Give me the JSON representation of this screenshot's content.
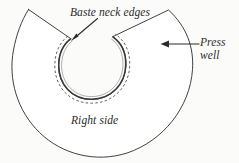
{
  "diagram": {
    "type": "sewing-pattern-illustration",
    "background_color": "#fbfbfa",
    "ink_color": "#2b2b2b",
    "labels": {
      "baste_neck_edges": "Baste neck edges",
      "press_well_line1": "Press",
      "press_well_line2": "well",
      "right_side": "Right side"
    },
    "annotations": [
      {
        "name": "baste-neck-edges",
        "text": "Baste neck edges",
        "arrow": "diagonal-down-left",
        "points_to": "neck-edge-upper-left"
      },
      {
        "name": "press-well",
        "text": "Press well",
        "arrow": "horizontal-left",
        "points_to": "outer-fabric-body-right"
      },
      {
        "name": "right-side",
        "text": "Right side",
        "arrow": "none",
        "points_to": "fabric-face"
      }
    ],
    "shape": {
      "outer_edge": "solid",
      "neck_edge": "solid-double",
      "basting_line": "dashed",
      "notch": "wedge cut at top center"
    }
  }
}
